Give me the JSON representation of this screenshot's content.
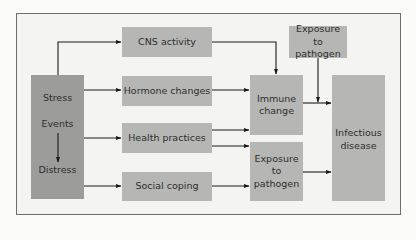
{
  "diagram": {
    "source_box": {
      "labels": [
        "Stress",
        "Events",
        "Distress"
      ]
    },
    "mediators": [
      {
        "id": "cns",
        "label": "CNS activity"
      },
      {
        "id": "hormone",
        "label": "Hormone changes"
      },
      {
        "id": "health",
        "label": "Health practices"
      },
      {
        "id": "social",
        "label": "Social coping"
      }
    ],
    "exposure_top": {
      "label": "Exposure to pathogen"
    },
    "immune": {
      "label": "Immune change"
    },
    "exposure_lower": {
      "label": "Exposure to pathogen"
    },
    "outcome": {
      "label": "Infectious disease"
    },
    "edges": [
      {
        "from": "Stress",
        "to": "CNS activity"
      },
      {
        "from": "Stress",
        "to": "Hormone changes"
      },
      {
        "from": "Stress",
        "to": "Health practices"
      },
      {
        "from": "Stress",
        "to": "Social coping"
      },
      {
        "from": "Events",
        "to": "Distress"
      },
      {
        "from": "CNS activity",
        "to": "Immune change"
      },
      {
        "from": "Hormone changes",
        "to": "Immune change"
      },
      {
        "from": "Health practices",
        "to": "Immune change"
      },
      {
        "from": "Health practices",
        "to": "Exposure to pathogen (lower)"
      },
      {
        "from": "Social coping",
        "to": "Exposure to pathogen (lower)"
      },
      {
        "from": "Immune change",
        "to": "Infectious disease"
      },
      {
        "from": "Exposure to pathogen (top)",
        "to": "Infectious disease"
      },
      {
        "from": "Exposure to pathogen (lower)",
        "to": "Infectious disease"
      }
    ],
    "colors": {
      "box_fill": "#b6b6b4",
      "source_fill": "#9c9c9a",
      "arrow": "#1a1a1a",
      "frame_border": "#6e6e6e",
      "background": "#f4f4f2"
    }
  }
}
